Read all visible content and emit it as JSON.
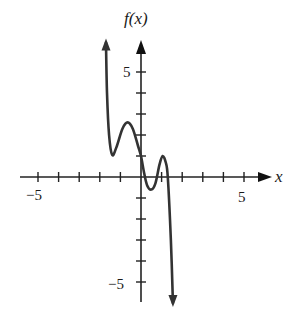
{
  "chart_data": {
    "type": "line",
    "title": "",
    "xlabel": "x",
    "ylabel": "f(x)",
    "xlim": [
      -6,
      6
    ],
    "ylim": [
      -6,
      6
    ],
    "grid": false,
    "x_ticks": [
      -5,
      -4,
      -3,
      -2,
      -1,
      0,
      1,
      2,
      3,
      4,
      5
    ],
    "y_ticks": [
      -5,
      -4,
      -3,
      -2,
      -1,
      0,
      1,
      2,
      3,
      4,
      5
    ],
    "x_tick_labels": {
      "-5": "−5",
      "5": "5"
    },
    "y_tick_labels": {
      "-5": "−5",
      "5": "5"
    },
    "series": [
      {
        "name": "f(x)",
        "color": "#333333",
        "end_behavior": {
          "left": "up arrow",
          "right": "down arrow"
        },
        "points": [
          {
            "x": -1.7,
            "y": 6.4
          },
          {
            "x": -1.65,
            "y": 4.0
          },
          {
            "x": -1.55,
            "y": 2.0
          },
          {
            "x": -1.4,
            "y": 1.05
          },
          {
            "x": -1.2,
            "y": 1.4
          },
          {
            "x": -0.9,
            "y": 2.3
          },
          {
            "x": -0.65,
            "y": 2.6
          },
          {
            "x": -0.4,
            "y": 2.3
          },
          {
            "x": -0.15,
            "y": 1.5
          },
          {
            "x": 0.0,
            "y": 1.0
          },
          {
            "x": 0.15,
            "y": 0.2
          },
          {
            "x": 0.3,
            "y": -0.4
          },
          {
            "x": 0.5,
            "y": -0.6
          },
          {
            "x": 0.7,
            "y": -0.3
          },
          {
            "x": 0.9,
            "y": 0.6
          },
          {
            "x": 1.05,
            "y": 1.0
          },
          {
            "x": 1.2,
            "y": 0.7
          },
          {
            "x": 1.3,
            "y": 0.0
          },
          {
            "x": 1.45,
            "y": -3.0
          },
          {
            "x": 1.55,
            "y": -6.0
          }
        ]
      }
    ],
    "key_features": {
      "local_maxima": [
        {
          "x": -0.65,
          "y": 2.6
        },
        {
          "x": 1.05,
          "y": 1.0
        }
      ],
      "local_minima": [
        {
          "x": -1.4,
          "y": 1.0
        },
        {
          "x": 0.5,
          "y": -0.6
        }
      ],
      "y_intercept": 1.0
    }
  },
  "labels": {
    "y_axis": "f(x)",
    "x_axis": "x",
    "x_neg5": "−5",
    "x_pos5": "5",
    "y_pos5": "5",
    "y_neg5": "−5"
  }
}
